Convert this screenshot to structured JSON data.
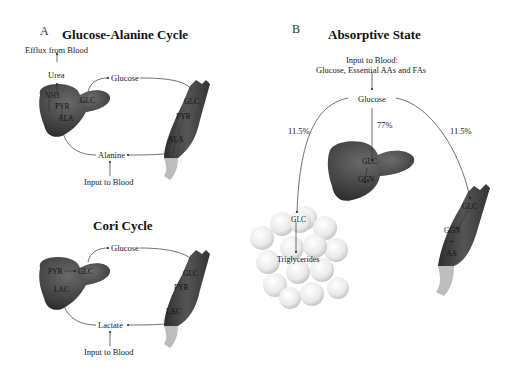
{
  "panel_a": {
    "letter": "A",
    "glucose_alanine": {
      "title": "Glucose-Alanine Cycle",
      "efflux": "Efflux from Blood",
      "urea": "Urea",
      "glucose": "Glucose",
      "alanine": "Alanine",
      "input": "Input to Blood",
      "liver_labels": {
        "nh3": "NH3",
        "pyr": "PYR",
        "ala": "ALA",
        "glc": "GLC"
      },
      "muscle_labels": {
        "glc": "GLC",
        "pyr": "PYR",
        "ala": "ALA"
      }
    },
    "cori": {
      "title": "Cori Cycle",
      "glucose": "Glucose",
      "lactate": "Lactate",
      "input": "Input to Blood",
      "liver_labels": {
        "pyr": "PYR",
        "glc": "GLC",
        "lac": "LAC"
      },
      "muscle_labels": {
        "glc": "GLC",
        "pyr": "PYR",
        "lac": "LAC"
      }
    }
  },
  "panel_b": {
    "letter": "B",
    "title": "Absorptive State",
    "input_line1": "Input to Blood:",
    "input_line2": "Glucose, Essential AAs and FAs",
    "glucose": "Glucose",
    "pct_left": "11.5%",
    "pct_center": "77%",
    "pct_right": "11.5%",
    "liver_labels": {
      "glc": "GLC",
      "ggn": "GGN"
    },
    "adipose_labels": {
      "glc": "GLC",
      "tg": "Triglycerides"
    },
    "muscle_labels": {
      "glc": "GLC",
      "ggn": "GGN",
      "plus": "+",
      "aa": "AA"
    }
  }
}
